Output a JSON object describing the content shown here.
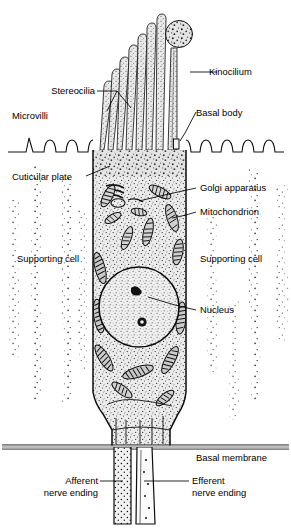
{
  "figure": {
    "background_color": "#ffffff",
    "ink_color": "#000000",
    "cytoplasm_fill": "#e8e8e8",
    "nucleus_fill": "#efefef"
  },
  "labels": {
    "kinocilium": "Kinocilium",
    "stereocilia": "Stereocilia",
    "microvilli": "Microvilli",
    "basal_body": "Basal body",
    "cuticular_plate": "Cuticular plate",
    "golgi_apparatus": "Golgi apparatus",
    "mitochondrion": "Mitochondrion",
    "supporting_cell_left": "Supporting cell",
    "supporting_cell_right": "Supporting cell",
    "nucleus": "Nucleus",
    "basal_membrane": "Basal membrane",
    "afferent_line1": "Afferent",
    "afferent_line2": "nerve ending",
    "efferent_line1": "Efferent",
    "efferent_line2": "nerve ending"
  },
  "structures": {
    "stereocilia_count": 7,
    "kinocilium_count": 1,
    "microvilli_left_count": 5,
    "microvilli_right_count": 6,
    "nerve_endings": [
      "afferent",
      "efferent"
    ]
  }
}
